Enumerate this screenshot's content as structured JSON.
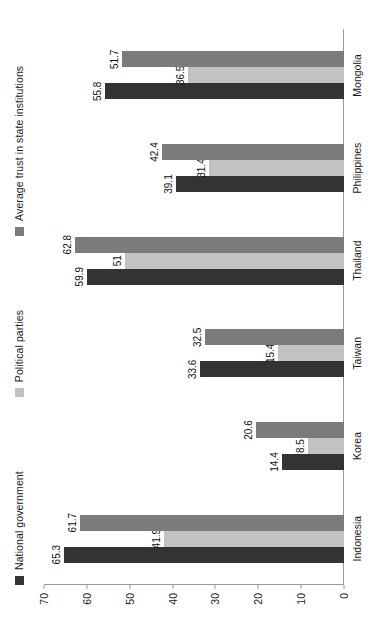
{
  "chart_data": {
    "type": "bar",
    "title": "",
    "subtitle": "",
    "xlabel": "",
    "ylabel": "",
    "orientation": "vertical-bars-rendered-rotated-90",
    "grid": false,
    "legend_position": "top",
    "ylim": [
      0,
      70
    ],
    "yticks": [
      "0",
      "10",
      "20",
      "30",
      "40",
      "50",
      "60",
      "70"
    ],
    "categories": [
      "Indonesia",
      "Korea",
      "Taiwan",
      "Thailand",
      "Philippines",
      "Mongolia"
    ],
    "series": [
      {
        "name": "National government",
        "color": "#333333",
        "values": [
          65.3,
          14.4,
          33.6,
          59.9,
          39.1,
          55.8
        ],
        "labels": [
          "65.3",
          "14.4",
          "33.6",
          "59.9",
          "39.1",
          "55.8"
        ]
      },
      {
        "name": "Political parties",
        "color": "#c2c2c2",
        "values": [
          41.9,
          8.5,
          15.4,
          51,
          31.4,
          36.5
        ],
        "labels": [
          "41.9",
          "8.5",
          "15.4",
          "51",
          "31.4",
          "36.5"
        ]
      },
      {
        "name": "Average trust in state institutions",
        "color": "#7b7b7b",
        "values": [
          61.7,
          20.6,
          32.5,
          62.8,
          42.4,
          51.7
        ],
        "labels": [
          "61.7",
          "20.6",
          "32.5",
          "62.8",
          "42.4",
          "51.7"
        ]
      }
    ]
  },
  "legend": {
    "items": [
      {
        "label": "National government",
        "color": "#333333"
      },
      {
        "label": "Political parties",
        "color": "#c2c2c2"
      },
      {
        "label": "Average trust in state institutions",
        "color": "#7b7b7b"
      }
    ]
  },
  "axis": {
    "ticks": [
      "0",
      "10",
      "20",
      "30",
      "40",
      "50",
      "60",
      "70"
    ]
  }
}
